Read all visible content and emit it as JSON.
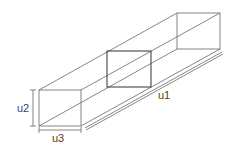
{
  "diagram": {
    "type": "isometric-box-dimensions",
    "labels": {
      "length": "u1",
      "height": "u2",
      "width": "u3"
    },
    "colors": {
      "line": "#555555",
      "section": "#444444",
      "background": "#ffffff"
    }
  }
}
